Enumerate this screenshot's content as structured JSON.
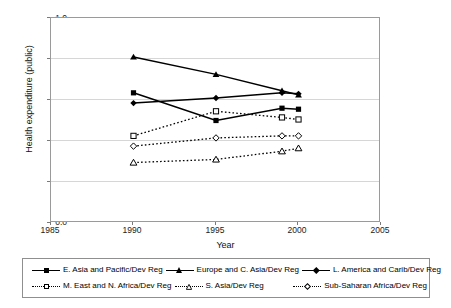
{
  "chart_data": {
    "type": "line",
    "title": "",
    "xlabel": "Year",
    "ylabel": "Health expenditure (public)",
    "xlim": [
      1985,
      2005
    ],
    "ylim": [
      0.0,
      1.0
    ],
    "xticks": [
      "1985",
      "1990",
      "1995",
      "2000",
      "2005"
    ],
    "yticks": [
      "0.0",
      "0.2",
      "0.4",
      "0.6",
      "0.8",
      "1.0"
    ],
    "grid": "horizontal",
    "legend_position": "bottom",
    "x": [
      1990,
      1995,
      1999,
      2000
    ],
    "series": [
      {
        "name": "E. Asia and Pacific/Dev Reg",
        "marker": "square-filled",
        "line": "solid",
        "color": "#000000",
        "values": [
          0.635,
          0.5,
          0.56,
          0.555
        ]
      },
      {
        "name": "Europe and C. Asia/Dev Reg",
        "marker": "triangle-filled",
        "line": "solid",
        "color": "#000000",
        "values": [
          0.81,
          0.725,
          0.645,
          0.625
        ]
      },
      {
        "name": "L. America and Carib/Dev Reg",
        "marker": "diamond-filled",
        "line": "solid",
        "color": "#000000",
        "values": [
          0.585,
          0.61,
          0.635,
          0.63
        ]
      },
      {
        "name": "M. East and N. Africa/Dev Reg",
        "marker": "square-open",
        "line": "dotted",
        "color": "#000000",
        "values": [
          0.425,
          0.545,
          0.515,
          0.505
        ]
      },
      {
        "name": "S. Asia/Dev Reg",
        "marker": "triangle-open",
        "line": "dotted",
        "color": "#000000",
        "values": [
          0.295,
          0.31,
          0.35,
          0.365
        ]
      },
      {
        "name": "Sub-Saharan Africa/Dev Reg",
        "marker": "diamond-open",
        "line": "dotted",
        "color": "#000000",
        "values": [
          0.375,
          0.415,
          0.425,
          0.425
        ]
      }
    ]
  },
  "axes": {
    "y_title": "Health expenditure (public)",
    "x_title": "Year",
    "y_ticks": [
      "1.0",
      "0.8",
      "0.6",
      "0.4",
      "0.2",
      "0.0"
    ],
    "x_ticks": [
      "1985",
      "1990",
      "1995",
      "2000",
      "2005"
    ]
  },
  "legend": {
    "items": [
      {
        "label": "E. Asia and Pacific/Dev Reg"
      },
      {
        "label": "Europe and C. Asia/Dev Reg"
      },
      {
        "label": "L. America and Carib/Dev Reg"
      },
      {
        "label": "M. East and N. Africa/Dev Reg"
      },
      {
        "label": "S. Asia/Dev Reg"
      },
      {
        "label": "Sub-Saharan Africa/Dev Reg"
      }
    ]
  }
}
